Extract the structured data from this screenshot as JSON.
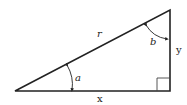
{
  "diagram": {
    "title": "",
    "type": "right-triangle",
    "labels": {
      "hypotenuse": "r",
      "base": "x",
      "height": "y",
      "angle_bottom_left": "a",
      "angle_top": "b"
    },
    "vertices": {
      "bottom_left": [
        15,
        91
      ],
      "bottom_right": [
        170,
        91
      ],
      "top_right": [
        170,
        10
      ]
    },
    "right_angle_marker": true,
    "colors": {
      "stroke": "#222222",
      "background": "#ffffff"
    }
  }
}
